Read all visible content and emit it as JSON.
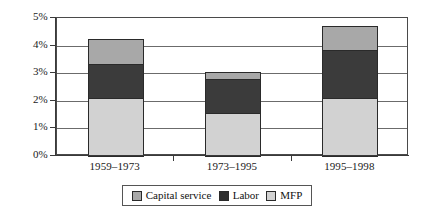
{
  "chart_data": {
    "type": "bar",
    "subtype": "stacked-bar",
    "title": "",
    "subtitle": "",
    "xlabel": "",
    "ylabel": "",
    "categories": [
      "1959–1973",
      "1973–1995",
      "1995–1998"
    ],
    "series": [
      {
        "name": "MFP",
        "color": "#d2d2d2",
        "values": [
          2.1,
          1.55,
          2.1
        ]
      },
      {
        "name": "Labor",
        "color": "#2e2e2e",
        "values": [
          1.25,
          1.25,
          1.75
        ]
      },
      {
        "name": "Capital service",
        "color": "#a8a8a8",
        "values": [
          0.9,
          0.25,
          0.85
        ]
      }
    ],
    "stack_order_bottom_to_top": [
      "MFP",
      "Labor",
      "Capital service"
    ],
    "totals": [
      4.25,
      3.05,
      4.7
    ],
    "ylim": [
      0,
      5
    ],
    "ytick_values": [
      0,
      1,
      2,
      3,
      4,
      5
    ],
    "ytick_labels": [
      "0%",
      "1%",
      "2%",
      "3%",
      "4%",
      "5%"
    ],
    "ytick_suffix": "%",
    "grid": true,
    "grid_axis": "y",
    "legend_position": "bottom",
    "legend_entries": [
      "Capital service",
      "Labor",
      "MFP"
    ]
  },
  "axes": {
    "y": {
      "ticks": [
        {
          "label": "5%",
          "value": 5
        },
        {
          "label": "4%",
          "value": 4
        },
        {
          "label": "3%",
          "value": 3
        },
        {
          "label": "2%",
          "value": 2
        },
        {
          "label": "1%",
          "value": 1
        },
        {
          "label": "0%",
          "value": 0
        }
      ]
    },
    "x": {
      "ticks": [
        {
          "label": "1959–1973"
        },
        {
          "label": "1973–1995"
        },
        {
          "label": "1995–1998"
        }
      ]
    }
  },
  "legend": {
    "items": [
      {
        "label": "Capital service",
        "swatch": "capital",
        "color": "#a8a8a8"
      },
      {
        "label": "Labor",
        "swatch": "labor",
        "color": "#2e2e2e"
      },
      {
        "label": "MFP",
        "swatch": "mfp",
        "color": "#d2d2d2"
      }
    ]
  },
  "colors": {
    "capital_service": "#a8a8a8",
    "labor": "#2e2e2e",
    "mfp": "#d2d2d2",
    "axis": "#3a3a3a",
    "gridline": "#6b6b6b",
    "background": "#ffffff"
  }
}
